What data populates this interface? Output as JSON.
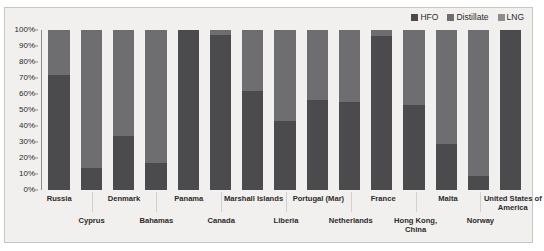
{
  "chart_data": {
    "type": "bar",
    "subtype": "stacked-100-percent",
    "title": "",
    "xlabel": "",
    "ylabel": "",
    "ylim": [
      0,
      100
    ],
    "ytick_labels": [
      "100%",
      "90%",
      "80%",
      "70%",
      "60%",
      "50%",
      "40%",
      "30%",
      "20%",
      "10%",
      "0%"
    ],
    "grid": false,
    "legend_position": "top-right",
    "categories": [
      "Russia",
      "Cyprus",
      "Denmark",
      "Bahamas",
      "Panama",
      "Canada",
      "Marshall Islands",
      "Liberia",
      "Portugal (Mar)",
      "Netherlands",
      "France",
      "Hong Kong, China",
      "Malta",
      "Norway",
      "United States of America"
    ],
    "series": [
      {
        "name": "HFO",
        "color": "#4b4b4d",
        "values": [
          72,
          14,
          34,
          17,
          100,
          97,
          62,
          43,
          56,
          55,
          96,
          53,
          29,
          9,
          100
        ]
      },
      {
        "name": "Distillate",
        "color": "#6e6e70",
        "values": [
          28,
          86,
          66,
          83,
          0,
          3,
          38,
          57,
          44,
          45,
          4,
          47,
          71,
          91,
          0
        ]
      },
      {
        "name": "LNG",
        "color": "#8e8e90",
        "values": [
          0,
          0,
          0,
          0,
          0,
          0,
          0,
          0,
          0,
          0,
          0,
          0,
          0,
          0,
          0
        ]
      }
    ]
  },
  "legend": {
    "items": [
      {
        "label": "HFO",
        "color": "#4b4b4d"
      },
      {
        "label": "Distillate",
        "color": "#6e6e70"
      },
      {
        "label": "LNG",
        "color": "#8e8e90"
      }
    ]
  },
  "colors": {
    "panel_background": "#f1f0ee",
    "panel_border": "#c9c6c2",
    "axis": "#8d8a87",
    "text": "#2b2b2b"
  }
}
